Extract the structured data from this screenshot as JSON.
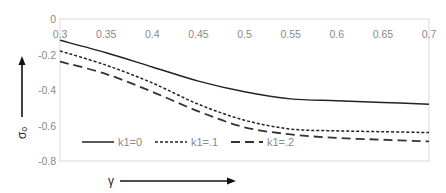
{
  "chart_data": {
    "type": "line",
    "title": "",
    "xlabel": "γ",
    "ylabel": "σₒ",
    "xlim": [
      0.3,
      0.7
    ],
    "ylim": [
      -0.8,
      0
    ],
    "x_ticks": [
      "0.3",
      "0.35",
      "0.4",
      "0.45",
      "0.5",
      "0.55",
      "0.6",
      "0.65",
      "0.7"
    ],
    "y_ticks": [
      "0",
      "-0.2",
      "-0.4",
      "-0.6",
      "-0.8"
    ],
    "x_axis_position": "top",
    "grid": false,
    "legend_position": "inside-bottom",
    "x": [
      0.3,
      0.35,
      0.4,
      0.45,
      0.5,
      0.55,
      0.6,
      0.65,
      0.7
    ],
    "series": [
      {
        "name": "k1=0",
        "style": "solid",
        "values": [
          -0.12,
          -0.19,
          -0.27,
          -0.35,
          -0.41,
          -0.45,
          -0.46,
          -0.47,
          -0.48
        ]
      },
      {
        "name": "k1=.1",
        "style": "dotted",
        "values": [
          -0.18,
          -0.26,
          -0.36,
          -0.48,
          -0.57,
          -0.62,
          -0.63,
          -0.635,
          -0.64
        ]
      },
      {
        "name": "k1=.2",
        "style": "dashed",
        "values": [
          -0.24,
          -0.31,
          -0.41,
          -0.52,
          -0.61,
          -0.65,
          -0.67,
          -0.68,
          -0.69
        ]
      }
    ]
  },
  "legend": {
    "items": [
      "k1=0",
      "k1=.1",
      "k1=.2"
    ]
  },
  "labels": {
    "x_axis": "γ",
    "y_axis": "σₒ"
  }
}
